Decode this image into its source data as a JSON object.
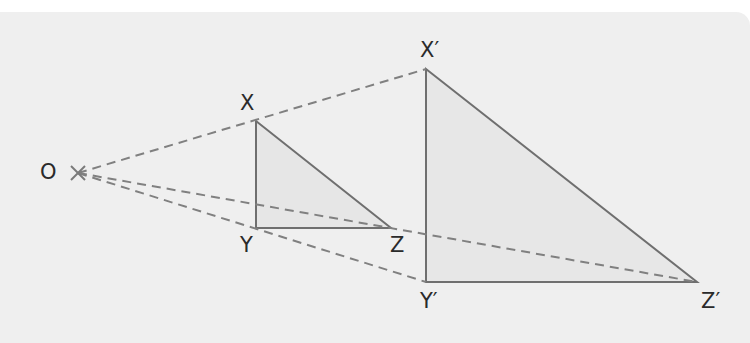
{
  "diagram": {
    "type": "enlargement",
    "centre": {
      "label": "O",
      "x": 78,
      "y": 173
    },
    "object": {
      "X": {
        "label": "X",
        "x": 256,
        "y": 121
      },
      "Y": {
        "label": "Y",
        "x": 256,
        "y": 228
      },
      "Z": {
        "label": "Z",
        "x": 391,
        "y": 228
      }
    },
    "image": {
      "X": {
        "label": "X′",
        "x": 426,
        "y": 69
      },
      "Y": {
        "label": "Y′",
        "x": 426,
        "y": 282
      },
      "Z": {
        "label": "Z′",
        "x": 697,
        "y": 282
      }
    },
    "colors": {
      "background": "#efefef",
      "fill": "#e6e6e6",
      "line": "#6f6f6f",
      "dash": "#808080",
      "text": "#2a2a2a"
    }
  }
}
